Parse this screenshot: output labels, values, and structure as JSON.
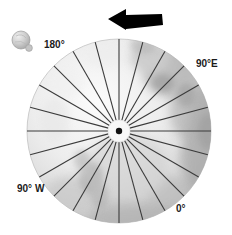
{
  "figure": {
    "name": "polar-meridian-diagram",
    "background_color": "#ffffff"
  },
  "body_disk": {
    "name": "planetary-disk",
    "center_x": 119,
    "center_y": 131,
    "radius": 92,
    "fill_light": "#f2f2f2",
    "fill_mid": "#cfcfcf",
    "fill_dark": "#a8a8a8",
    "edge_color": "#bfbfbf"
  },
  "meridians": {
    "count": 24,
    "spacing_degrees": 15,
    "line_color": "#3b3b3b",
    "line_width": 1.1,
    "inner_radius": 11,
    "outer_radius": 92
  },
  "pole_hub": {
    "name": "pole-hub",
    "ring_fill": "#f7f7f7",
    "ring_radius": 11,
    "dot_fill": "#111111",
    "dot_radius": 3.2
  },
  "rotation_arrow": {
    "name": "rotation-direction-arrow",
    "color": "#000000",
    "direction": "left",
    "x1": 162,
    "x2": 108,
    "y": 19
  },
  "inset_sphere": {
    "name": "inset-sphere",
    "center_x": 21,
    "center_y": 40,
    "radius": 9,
    "fill": "#c9c9c9",
    "highlight": "#eeeeee",
    "edge": "#9a9a9a",
    "nub_x": 29,
    "nub_y": 49,
    "nub_radius": 3.4
  },
  "longitude_labels": [
    {
      "id": "label-180",
      "name": "longitude-label-180",
      "text": "180°"
    },
    {
      "id": "label-90e",
      "name": "longitude-label-90e",
      "text": "90°E"
    },
    {
      "id": "label-0",
      "name": "longitude-label-0",
      "text": "0°"
    },
    {
      "id": "label-90w",
      "name": "longitude-label-90w",
      "text": "90° W"
    }
  ],
  "labels": {
    "lon_180": "180°",
    "lon_90e": "90°E",
    "lon_0": "0°",
    "lon_90w": "90° W"
  }
}
